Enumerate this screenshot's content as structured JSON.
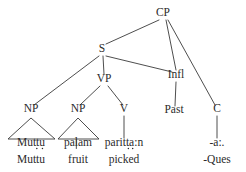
{
  "figure": {
    "kind": "syntax-tree",
    "language_example": "Tamil",
    "background_color": "#ffffff",
    "line_color": "#3a3a3a",
    "text_color": "#2b2b2b"
  },
  "nodes": {
    "cp": {
      "label": "CP",
      "x": 163,
      "y": 16
    },
    "s": {
      "label": "S",
      "x": 102,
      "y": 52
    },
    "infl": {
      "label": "Infl",
      "x": 176,
      "y": 78
    },
    "vp": {
      "label": "VP",
      "x": 104,
      "y": 82
    },
    "np1": {
      "label": "NP",
      "x": 31,
      "y": 112
    },
    "np2": {
      "label": "NP",
      "x": 78,
      "y": 112
    },
    "v": {
      "label": "V",
      "x": 124,
      "y": 112
    },
    "past": {
      "label": "Past",
      "x": 174,
      "y": 113
    },
    "c": {
      "label": "C",
      "x": 217,
      "y": 112
    }
  },
  "terminals": [
    {
      "id": "t-muttu",
      "form": "Muttu",
      "gloss": "Muttu",
      "x": 31,
      "form_y": 146,
      "gloss_y": 163,
      "underdots": 2,
      "underdot_after": 3
    },
    {
      "id": "t-palam",
      "form": "pa",
      "form_mid": "l",
      "form_end": "am",
      "gloss": "fruit",
      "x": 78,
      "form_y": 146,
      "gloss_y": 163,
      "retroflex_l": true
    },
    {
      "id": "t-parittan",
      "form": "paritta:n",
      "gloss": "picked",
      "x": 124,
      "form_y": 146,
      "gloss_y": 163,
      "underdots": 2,
      "underdot_after": 5
    },
    {
      "id": "t-ques",
      "form": "-a:.",
      "gloss": "-Ques",
      "x": 217,
      "form_y": 146,
      "gloss_y": 163
    }
  ],
  "edges": [
    {
      "from": "cp",
      "to": "s",
      "x1": 159,
      "y1": 20,
      "x2": 106,
      "y2": 44
    },
    {
      "from": "cp",
      "to": "infl",
      "x1": 166,
      "y1": 20,
      "x2": 176,
      "y2": 70
    },
    {
      "from": "cp",
      "to": "c",
      "x1": 168,
      "y1": 20,
      "x2": 215,
      "y2": 105
    },
    {
      "from": "s",
      "to": "np1",
      "x1": 99,
      "y1": 56,
      "x2": 34,
      "y2": 105
    },
    {
      "from": "s",
      "to": "vp",
      "x1": 103,
      "y1": 56,
      "x2": 104,
      "y2": 74
    },
    {
      "from": "s",
      "to": "infl",
      "x1": 106,
      "y1": 56,
      "x2": 172,
      "y2": 72
    },
    {
      "from": "vp",
      "to": "np2",
      "x1": 100,
      "y1": 86,
      "x2": 80,
      "y2": 105
    },
    {
      "from": "vp",
      "to": "v",
      "x1": 108,
      "y1": 86,
      "x2": 123,
      "y2": 105
    },
    {
      "from": "v",
      "to": "t-parittan",
      "x1": 124,
      "y1": 116,
      "x2": 124,
      "y2": 138
    },
    {
      "from": "infl",
      "to": "past",
      "x1": 176,
      "y1": 82,
      "x2": 175,
      "y2": 106
    },
    {
      "from": "c",
      "to": "t-ques",
      "x1": 217,
      "y1": 116,
      "x2": 217,
      "y2": 138
    }
  ],
  "triangles": [
    {
      "for": "np1",
      "apex_x": 31,
      "apex_y": 118,
      "left_x": 8,
      "right_x": 55,
      "base_y": 139
    },
    {
      "for": "np2",
      "apex_x": 78,
      "apex_y": 118,
      "left_x": 58,
      "right_x": 99,
      "base_y": 139
    }
  ]
}
